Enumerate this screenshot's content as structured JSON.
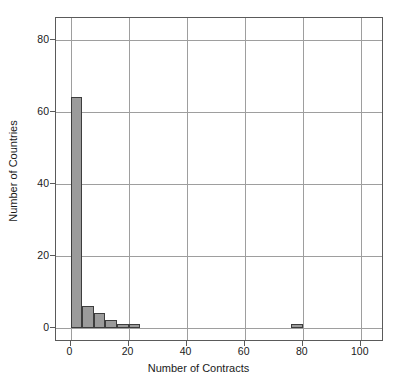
{
  "chart_data": {
    "type": "bar",
    "title": "",
    "subtitle": "",
    "xlabel": "Number of Contracts",
    "ylabel": "Number of Countries",
    "xlim": [
      -5,
      108
    ],
    "ylim": [
      -4,
      86
    ],
    "xticks": [
      0,
      20,
      40,
      60,
      80,
      100
    ],
    "xtick_labels": [
      "0",
      "20",
      "40",
      "60",
      "80",
      "100"
    ],
    "yticks": [
      0,
      20,
      40,
      60,
      80
    ],
    "ytick_labels": [
      "0",
      "20",
      "40",
      "60",
      "80"
    ],
    "grid": true,
    "grid_axis": "both",
    "legend": null,
    "bin_width": 4,
    "bar_fill_color": "#9b9b9b",
    "bar_edge_color": "#3d3d3d",
    "frame_color": "#5a5a5a",
    "grid_color": "#9e9e9e",
    "background_color": "#ffffff",
    "bins": [
      {
        "x0": 0,
        "x1": 4,
        "value": 64
      },
      {
        "x0": 4,
        "x1": 8,
        "value": 6
      },
      {
        "x0": 8,
        "x1": 12,
        "value": 4
      },
      {
        "x0": 12,
        "x1": 16,
        "value": 2
      },
      {
        "x0": 16,
        "x1": 20,
        "value": 1
      },
      {
        "x0": 20,
        "x1": 24,
        "value": 1
      },
      {
        "x0": 76,
        "x1": 80,
        "value": 1
      }
    ],
    "categories": [
      "0-4",
      "4-8",
      "8-12",
      "12-16",
      "16-20",
      "20-24",
      "76-80"
    ],
    "values": [
      64,
      6,
      4,
      2,
      1,
      1,
      1
    ],
    "annotations": []
  }
}
